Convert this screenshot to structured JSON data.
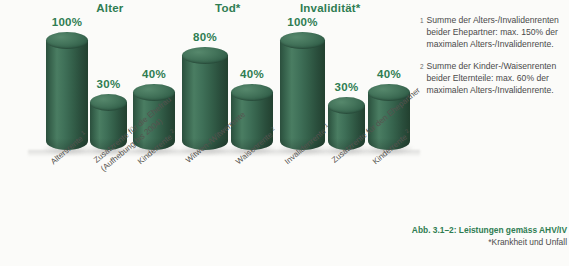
{
  "chart_data": {
    "type": "bar",
    "title": "Abb. 3.1–2: Leistungen gemäss AHV/IV",
    "subtitle": "*Krankheit und Unfall",
    "xlabel": "",
    "ylabel": "",
    "ylim": [
      0,
      100
    ],
    "grid": false,
    "legend": "none",
    "value_suffix": "%",
    "groups": [
      {
        "label": "Alter",
        "center_pct": 26.3
      },
      {
        "label": "Tod*",
        "center_pct": 54.5
      },
      {
        "label": "Invalidität*",
        "center_pct": 79.0
      }
    ],
    "categories": [
      "Altersrente",
      "Zusatzrente für die Ehefrau (Aufhebung bis 2004)",
      "Kinderrente",
      "Witwen-/Witwerrente",
      "Waisenrente",
      "Invalidenrente",
      "Zusatzrente für den Ehepartner",
      "Kinderrente"
    ],
    "values": [
      100,
      30,
      40,
      80,
      40,
      100,
      30,
      40
    ],
    "bars": [
      {
        "group": "Alter",
        "label_line1": "Altersrente",
        "label_line2": "",
        "footnote": "1",
        "value": 100,
        "value_label": "100%",
        "x": 46,
        "w": 42,
        "top": 40
      },
      {
        "group": "Alter",
        "label_line1": "Zusatzrente für die Ehefrau",
        "label_line2": "(Aufhebung bis 2004)",
        "footnote": "",
        "value": 30,
        "value_label": "30%",
        "x": 90,
        "w": 37,
        "top": 102
      },
      {
        "group": "Alter",
        "label_line1": "Kinderrente",
        "label_line2": "",
        "footnote": "2",
        "value": 40,
        "value_label": "40%",
        "x": 133,
        "w": 42,
        "top": 92
      },
      {
        "group": "Tod*",
        "label_line1": "Witwen-/Witwerrente",
        "label_line2": "",
        "footnote": "",
        "value": 80,
        "value_label": "80%",
        "x": 182,
        "w": 46,
        "top": 55
      },
      {
        "group": "Tod*",
        "label_line1": "Waisenrente",
        "label_line2": "",
        "footnote": "2",
        "value": 40,
        "value_label": "40%",
        "x": 231,
        "w": 42,
        "top": 92
      },
      {
        "group": "Invalidität*",
        "label_line1": "Invalidenrente",
        "label_line2": "",
        "footnote": "1",
        "value": 100,
        "value_label": "100%",
        "x": 280,
        "w": 45,
        "top": 40
      },
      {
        "group": "Invalidität*",
        "label_line1": "Zusatzrente für den Ehepartner",
        "label_line2": "",
        "footnote": "",
        "value": 30,
        "value_label": "30%",
        "x": 328,
        "w": 37,
        "top": 105
      },
      {
        "group": "Invalidität*",
        "label_line1": "Kinderrente",
        "label_line2": "",
        "footnote": "2",
        "value": 40,
        "value_label": "40%",
        "x": 368,
        "w": 42,
        "top": 92
      }
    ],
    "colors": {
      "bar_green": "#35604a",
      "bar_green_light": "#4a7d62",
      "bar_green_dark": "#22402f",
      "label_green": "#2f7d52",
      "text_gray": "#4a4a4a",
      "background": "#fbfbf9"
    }
  },
  "footnotes": [
    {
      "marker": "1",
      "text": "Summe der Alters-/Invalidenrenten beider Ehepartner: max. 150% der maximalen Alters-/Invalidenrente."
    },
    {
      "marker": "2",
      "text": "Summe der Kinder-/Waisenrenten beider Elternteile: max. 60% der maximalen Alters-/Invalidenrente."
    }
  ],
  "caption": {
    "line1": "Abb. 3.1–2: Leistungen gemäss AHV/IV",
    "line2": "*Krankheit und Unfall"
  }
}
